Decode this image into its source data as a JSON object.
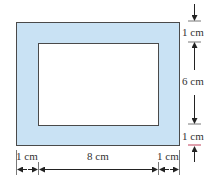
{
  "diagram": {
    "colors": {
      "frame_fill": "#c9e2f4",
      "frame_stroke": "#4a4a4a",
      "inner_fill": "#ffffff",
      "dimension_line": "#222222",
      "tick_red": "#c0405a"
    },
    "labels": {
      "top_border": "1 cm",
      "inner_height": "6 cm",
      "bottom_border": "1 cm",
      "left_border": "1 cm",
      "inner_width": "8 cm",
      "right_border": "1 cm"
    },
    "dimensions": {
      "inner_width_cm": 8,
      "inner_height_cm": 6,
      "border_cm": 1
    }
  }
}
